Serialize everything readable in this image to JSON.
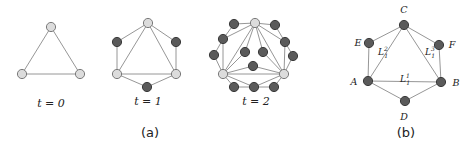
{
  "panels": {
    "a": {
      "label": "(a)",
      "graphs": [
        {
          "caption": "t = 0",
          "nodes": [
            {
              "id": "top",
              "x": 51,
              "y": 27,
              "kind": "light"
            },
            {
              "id": "left",
              "x": 22,
              "y": 74,
              "kind": "light"
            },
            {
              "id": "right",
              "x": 80,
              "y": 74,
              "kind": "light"
            }
          ],
          "edges": [
            [
              "top",
              "left"
            ],
            [
              "top",
              "right"
            ],
            [
              "left",
              "right"
            ]
          ]
        },
        {
          "caption": "t = 1",
          "nodes": [
            {
              "id": "top",
              "x": 148,
              "y": 23,
              "kind": "light"
            },
            {
              "id": "left",
              "x": 117,
              "y": 74,
              "kind": "light"
            },
            {
              "id": "right",
              "x": 176,
              "y": 74,
              "kind": "light"
            },
            {
              "id": "ul",
              "x": 117,
              "y": 42,
              "kind": "dark"
            },
            {
              "id": "ur",
              "x": 176,
              "y": 42,
              "kind": "dark"
            },
            {
              "id": "bot",
              "x": 147,
              "y": 87,
              "kind": "dark"
            }
          ],
          "edges": [
            [
              "top",
              "left"
            ],
            [
              "top",
              "right"
            ],
            [
              "left",
              "right"
            ],
            [
              "top",
              "ul"
            ],
            [
              "ul",
              "left"
            ],
            [
              "top",
              "ur"
            ],
            [
              "ur",
              "right"
            ],
            [
              "left",
              "bot"
            ],
            [
              "bot",
              "right"
            ]
          ]
        },
        {
          "caption": "t = 2",
          "nodes": [
            {
              "id": "top",
              "x": 255,
              "y": 23,
              "kind": "light"
            },
            {
              "id": "left",
              "x": 223,
              "y": 74,
              "kind": "light"
            },
            {
              "id": "right",
              "x": 284,
              "y": 74,
              "kind": "light"
            },
            {
              "id": "l1",
              "x": 234,
              "y": 24,
              "kind": "dark"
            },
            {
              "id": "l2",
              "x": 223,
              "y": 39,
              "kind": "dark"
            },
            {
              "id": "l3",
              "x": 214,
              "y": 55,
              "kind": "dark"
            },
            {
              "id": "r1",
              "x": 275,
              "y": 25,
              "kind": "dark"
            },
            {
              "id": "r2",
              "x": 285,
              "y": 42,
              "kind": "dark"
            },
            {
              "id": "r3",
              "x": 293,
              "y": 56,
              "kind": "dark"
            },
            {
              "id": "il",
              "x": 245,
              "y": 52,
              "kind": "dark"
            },
            {
              "id": "ir",
              "x": 263,
              "y": 52,
              "kind": "dark"
            },
            {
              "id": "ic",
              "x": 253,
              "y": 66,
              "kind": "dark"
            },
            {
              "id": "b1",
              "x": 234,
              "y": 87,
              "kind": "dark"
            },
            {
              "id": "b2",
              "x": 254,
              "y": 87,
              "kind": "dark"
            },
            {
              "id": "b3",
              "x": 274,
              "y": 87,
              "kind": "dark"
            }
          ],
          "edges": [
            [
              "top",
              "left"
            ],
            [
              "top",
              "right"
            ],
            [
              "left",
              "right"
            ],
            [
              "top",
              "l1"
            ],
            [
              "l1",
              "l2"
            ],
            [
              "l2",
              "left"
            ],
            [
              "top",
              "l2"
            ],
            [
              "l3",
              "left"
            ],
            [
              "l2",
              "l3"
            ],
            [
              "top",
              "r1"
            ],
            [
              "r1",
              "r2"
            ],
            [
              "r2",
              "right"
            ],
            [
              "top",
              "r2"
            ],
            [
              "r3",
              "right"
            ],
            [
              "r2",
              "r3"
            ],
            [
              "top",
              "il"
            ],
            [
              "il",
              "left"
            ],
            [
              "top",
              "ir"
            ],
            [
              "ir",
              "right"
            ],
            [
              "left",
              "ic"
            ],
            [
              "ic",
              "right"
            ],
            [
              "left",
              "b1"
            ],
            [
              "b1",
              "b2"
            ],
            [
              "b2",
              "b3"
            ],
            [
              "b3",
              "right"
            ],
            [
              "left",
              "b2"
            ],
            [
              "b2",
              "right"
            ]
          ]
        }
      ]
    },
    "b": {
      "label": "(b)",
      "nodes": [
        {
          "id": "C",
          "x": 404,
          "y": 25,
          "label": "C",
          "lx": 404,
          "ly": 13
        },
        {
          "id": "E",
          "x": 369,
          "y": 43,
          "label": "E",
          "lx": 358,
          "ly": 46
        },
        {
          "id": "F",
          "x": 439,
          "y": 45,
          "label": "F",
          "lx": 452,
          "ly": 48
        },
        {
          "id": "A",
          "x": 368,
          "y": 81,
          "label": "A",
          "lx": 354,
          "ly": 85
        },
        {
          "id": "B",
          "x": 441,
          "y": 82,
          "label": "B",
          "lx": 456,
          "ly": 86
        },
        {
          "id": "D",
          "x": 405,
          "y": 101,
          "label": "D",
          "lx": 404,
          "ly": 120
        }
      ],
      "edges": [
        [
          "C",
          "E"
        ],
        [
          "E",
          "A"
        ],
        [
          "C",
          "A"
        ],
        [
          "C",
          "F"
        ],
        [
          "F",
          "B"
        ],
        [
          "C",
          "B"
        ],
        [
          "A",
          "B"
        ],
        [
          "A",
          "D"
        ],
        [
          "D",
          "B"
        ]
      ],
      "edge_labels": [
        {
          "base": "L",
          "sub": "1",
          "sup": "2",
          "x": 378,
          "y": 55
        },
        {
          "base": "L",
          "sub": "1",
          "sup": "3",
          "x": 425,
          "y": 55
        },
        {
          "base": "L",
          "sub": "1",
          "sup": "1",
          "x": 400,
          "y": 82
        }
      ]
    }
  },
  "colors": {
    "node_light": "#dcdcdc",
    "node_dark": "#5a5a5a",
    "edge": "#8a8a8a"
  }
}
